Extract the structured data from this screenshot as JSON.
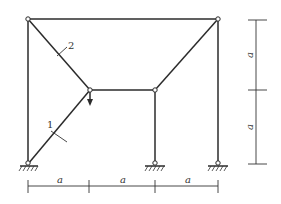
{
  "diagram": {
    "type": "structural-frame",
    "member_labels": [
      "1",
      "2"
    ],
    "load": {
      "direction": "down",
      "at": "inner-node"
    },
    "dimensions": {
      "horizontal": [
        "a",
        "a",
        "a"
      ],
      "vertical": [
        "a",
        "a"
      ]
    },
    "colors": {
      "line": "#2b2b2b",
      "background": "#ffffff"
    }
  }
}
